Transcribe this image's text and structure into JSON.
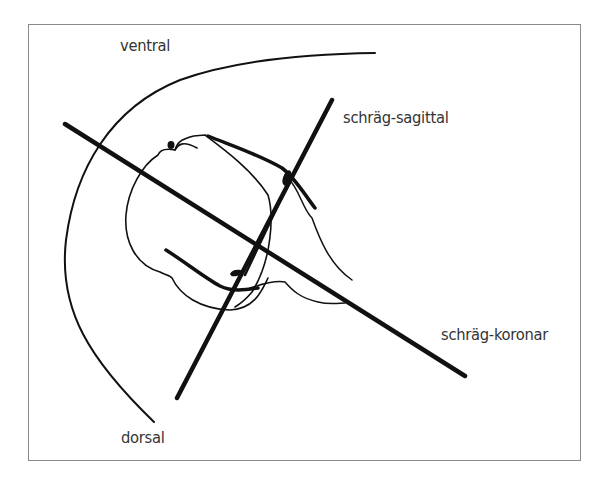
{
  "labels": {
    "ventral": "ventral",
    "dorsal": "dorsal",
    "sagittal": "schräg-sagittal",
    "coronal": "schräg-koronar"
  },
  "colors": {
    "line": "#111111",
    "text": "#333333",
    "frame": "#8a8a8a"
  }
}
